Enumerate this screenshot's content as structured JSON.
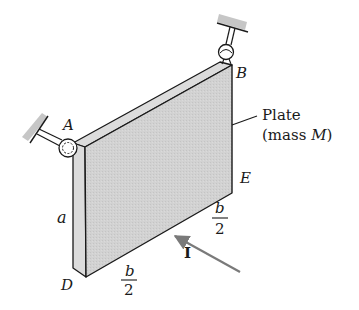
{
  "figure": {
    "type": "mechanics-diagram"
  },
  "labels": {
    "point_a": "A",
    "point_b": "B",
    "point_d": "D",
    "point_e": "E",
    "side_a": "a",
    "plate_line1": "Plate",
    "plate_line2_prefix": "(mass ",
    "plate_mass_symbol": "M",
    "plate_line2_suffix": ")",
    "half_b_left_num": "b",
    "half_b_left_den": "2",
    "half_b_right_num": "b",
    "half_b_right_den": "2",
    "impulse": "I"
  },
  "colors": {
    "plate_fill": "#cfcfcf",
    "edge_fill": "#dcdcdc",
    "line": "#1a1a1a",
    "arrow": "#7a7a7a",
    "wall_hatch": "#bdbdbd"
  }
}
